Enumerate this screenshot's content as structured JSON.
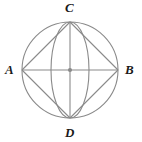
{
  "figure": {
    "kind": "geometry-diagram",
    "background_color": "#ffffff",
    "stroke_color": "#8a8a8a",
    "label_color": "#1a1a1a",
    "center_dot_color": "#8a8a8a",
    "labels": {
      "left": "A",
      "right": "B",
      "top": "C",
      "bottom": "D"
    },
    "geometry": {
      "center": {
        "x": 70,
        "y": 70
      },
      "radius": 48,
      "points": {
        "A": {
          "x": 22,
          "y": 70
        },
        "B": {
          "x": 118,
          "y": 70
        },
        "C": {
          "x": 70,
          "y": 22
        },
        "D": {
          "x": 70,
          "y": 118
        }
      },
      "ellipse_arc_half_width": 19
    }
  }
}
